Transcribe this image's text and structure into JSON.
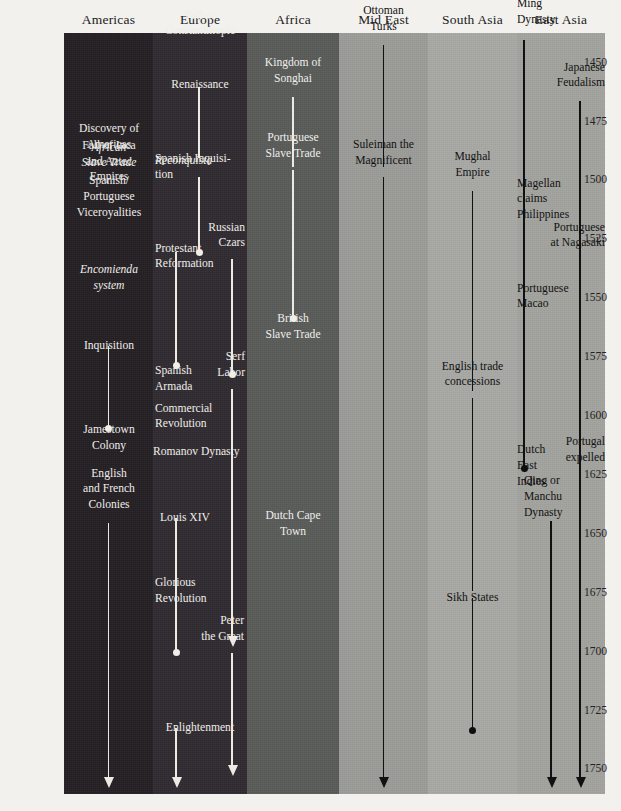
{
  "chart_data": {
    "type": "table",
    "xlabel": "Region",
    "ylabel": "Year",
    "ylim": [
      1437,
      1760
    ],
    "grid": false,
    "legend": "none",
    "tick_labels": [
      "1450",
      "1475",
      "1500",
      "1525",
      "1550",
      "1575",
      "1600",
      "1625",
      "1650",
      "1675",
      "1700",
      "1725",
      "1750"
    ],
    "categories": [
      "Americas",
      "Europe",
      "Africa",
      "Mid East",
      "South Asia",
      "East Asia"
    ],
    "series": [
      {
        "name": "Americas",
        "color": "#241f23",
        "text_color": "#efeeea",
        "events": [
          {
            "label": "Discovery of\nAmericas",
            "start": 1492
          },
          {
            "label": "African\nSlave Trade",
            "start": 1500,
            "italic": true
          },
          {
            "label": "Fall of Inca\nand Aztec\nEmpires",
            "start": 1505
          },
          {
            "label": "Spanish/\nPortuguese\nViceroyalities",
            "start": 1520
          },
          {
            "label": "Encomienda\nsystem",
            "start": 1552,
            "italic": true
          },
          {
            "label": "Inquisition",
            "start": 1570,
            "line_to": 1605,
            "end_marker": "dot"
          },
          {
            "label": "Jamestown\nColony",
            "start": 1607
          },
          {
            "label": "English\nand French\nColonies",
            "start": 1645,
            "line_to": 1757,
            "end_marker": "arrow"
          }
        ]
      },
      {
        "name": "Europe",
        "color": "#302b30",
        "text_color": "#efeeea",
        "events": [
          {
            "label": "Fall of\nConstantinople",
            "start": 1444
          },
          {
            "label": "Renaissance",
            "start": 1460,
            "line_to": 1490,
            "end_marker": "none"
          },
          {
            "label": "Reconquista",
            "start": 1492,
            "italic": true
          },
          {
            "label": "Spanish Inquisi-\ntion",
            "start": 1498,
            "line_to": 1530,
            "end_marker": "dot"
          },
          {
            "label": "Protestant\nReformation",
            "start": 1530,
            "line_to": 1578,
            "end_marker": "dot"
          },
          {
            "label": "Russian\nCzars",
            "start": 1533,
            "line_to": 1582,
            "end_marker": "dot"
          },
          {
            "label": "Spanish\nArmada",
            "start": 1582
          },
          {
            "label": "Serf\nLabor",
            "start": 1588,
            "line_to": 1697,
            "end_marker": "arrow"
          },
          {
            "label": "Commercial\nRevolution",
            "start": 1598
          },
          {
            "label": "Romanov Dynasty",
            "start": 1615
          },
          {
            "label": "Louis XIV",
            "start": 1643,
            "line_to": 1700,
            "end_marker": "dot"
          },
          {
            "label": "Glorious\nRevolution",
            "start": 1672
          },
          {
            "label": "Peter\nthe Great",
            "start": 1700,
            "line_to": 1752,
            "end_marker": "arrow"
          },
          {
            "label": "Enlightenment",
            "start": 1732,
            "line_to": 1757,
            "end_marker": "arrow"
          }
        ]
      },
      {
        "name": "Africa",
        "color": "#595b59",
        "text_color": "#efeeea",
        "events": [
          {
            "label": "Kingdom of\nSonghai",
            "start": 1464,
            "line_to": 1494,
            "end_marker": "none"
          },
          {
            "label": "Portuguese\nSlave Trade",
            "start": 1495,
            "line_to": 1558,
            "end_marker": "dot"
          },
          {
            "label": "British\nSlave Trade",
            "start": 1560
          },
          {
            "label": "Dutch Cape\nTown",
            "start": 1652
          }
        ]
      },
      {
        "name": "Mid East",
        "color": "#9b9b97",
        "text_color": "#121212",
        "events": [
          {
            "label": "Ottoman\nTurks",
            "start": 1442,
            "line_to": 1494,
            "end_marker": "none"
          },
          {
            "label": "Suleiman the\nMagnificent",
            "start": 1498,
            "line_to": 1757,
            "end_marker": "arrow"
          }
        ]
      },
      {
        "name": "South Asia",
        "color": "#a8a8a4",
        "text_color": "#121212",
        "events": [
          {
            "label": "Mughal\nEmpire",
            "start": 1504,
            "line_to": 1589,
            "end_marker": "none"
          },
          {
            "label": "English trade\nconcessions",
            "start": 1592,
            "line_to": 1674,
            "end_marker": "none"
          },
          {
            "label": "Sikh States",
            "start": 1677,
            "line_to": 1733,
            "end_marker": "dot"
          }
        ]
      },
      {
        "name": "East Asia",
        "color": "#a3a39e",
        "text_color": "#121212",
        "events": [
          {
            "label": "Ming\nDynasty",
            "start": 1440,
            "line_to": 1622,
            "end_marker": "dot"
          },
          {
            "label": "Japanese\nFeudalism",
            "start": 1466,
            "line_to": 1629,
            "end_marker": "none"
          },
          {
            "label": "Magellan\nclaims\nPhilippines",
            "start": 1521
          },
          {
            "label": "Portuguese\nat Nagasaki",
            "start": 1533
          },
          {
            "label": "Portuguese\nMacao",
            "start": 1553
          },
          {
            "label": "Dutch\nEast\nIndies",
            "start": 1624
          },
          {
            "label": "Portugal\nexpelled",
            "start": 1625,
            "line_to": 1757,
            "end_marker": "arrow"
          },
          {
            "label": "Qing or\nManchu\nDynasty",
            "start": 1644,
            "line_to": 1757,
            "end_marker": "arrow"
          }
        ]
      }
    ]
  },
  "headers": {
    "americas": "Americas",
    "europe": "Europe",
    "africa": "Africa",
    "mid_east": "Mid East",
    "south_asia": "South Asia",
    "east_asia": "East Asia"
  },
  "years": [
    "1450",
    "1475",
    "1500",
    "1525",
    "1550",
    "1575",
    "1600",
    "1625",
    "1650",
    "1675",
    "1700",
    "1725",
    "1750"
  ],
  "events": {
    "americas": [
      "Discovery of\nAmericas",
      "African\nSlave Trade",
      "Fall of Inca\nand Aztec\nEmpires",
      "Spanish/\nPortuguese\nViceroyalities",
      "Encomienda\nsystem",
      "Inquisition",
      "Jamestown\nColony",
      "English\nand French\nColonies"
    ],
    "europe": [
      "Fall of\nConstantinople",
      "Renaissance",
      "Reconquista",
      "Spanish Inquisi-\ntion",
      "Protestant\nReformation",
      "Russian\nCzars",
      "Spanish\nArmada",
      "Serf\nLabor",
      "Commercial\nRevolution",
      "Romanov Dynasty",
      "Louis XIV",
      "Glorious\nRevolution",
      "Peter\nthe Great",
      "Enlightenment"
    ],
    "africa": [
      "Kingdom of\nSonghai",
      "Portuguese\nSlave Trade",
      "British\nSlave Trade",
      "Dutch Cape\nTown"
    ],
    "mid_east": [
      "Ottoman\nTurks",
      "Suleiman the\nMagnificent"
    ],
    "south_asia": [
      "Mughal\nEmpire",
      "English trade\nconcessions",
      "Sikh States"
    ],
    "east_asia": [
      "Ming\nDynasty",
      "Japanese\nFeudalism",
      "Magellan\nclaims\nPhilippines",
      "Portuguese\nat Nagasaki",
      "Portuguese\nMacao",
      "Dutch\nEast\nIndies",
      "Portugal\nexpelled",
      "Qing or\nManchu\nDynasty"
    ]
  },
  "colors": {
    "page_background": "#f2f1ee",
    "americas_band": "#241f23",
    "europe_band": "#302b30",
    "africa_band": "#595b59",
    "mid_east_band": "#9b9b97",
    "south_asia_band": "#a8a8a4",
    "east_asia_band": "#a3a39e",
    "light_text": "#efeeea",
    "dark_text": "#121212"
  }
}
